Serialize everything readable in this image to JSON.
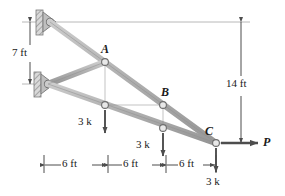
{
  "figure": {
    "type": "truss-free-body-diagram",
    "colors": {
      "member_fill": "#b3b3b3",
      "member_stroke": "#8c8c8c",
      "joint_fill": "#e6e6e6",
      "joint_stroke": "#737373",
      "arrow": "#4d4d4d",
      "dimension_line": "#4d4d4d",
      "extension_line": "#999999",
      "text": "#1a1a1a",
      "background": "#ffffff"
    }
  },
  "joints": [
    {
      "name": "top-support",
      "label": "",
      "x": 50,
      "y": 22
    },
    {
      "name": "lower-support",
      "label": "",
      "x": 48,
      "y": 84
    },
    {
      "name": "joint-a",
      "label": "A",
      "x": 105,
      "y": 62
    },
    {
      "name": "joint-d",
      "label": "",
      "x": 105,
      "y": 105
    },
    {
      "name": "joint-b",
      "label": "B",
      "x": 163,
      "y": 105
    },
    {
      "name": "joint-e",
      "label": "",
      "x": 163,
      "y": 128
    },
    {
      "name": "joint-c",
      "label": "C",
      "x": 216,
      "y": 143
    }
  ],
  "joint_labels": {
    "a": "A",
    "b": "B",
    "c": "C"
  },
  "loads": [
    {
      "name": "load-at-d",
      "label": "3 k",
      "direction": "down",
      "magnitude": 3,
      "unit": "k"
    },
    {
      "name": "load-at-e",
      "label": "3 k",
      "direction": "down",
      "magnitude": 3,
      "unit": "k"
    },
    {
      "name": "load-at-c-vertical",
      "label": "3 k",
      "direction": "down",
      "magnitude": 3,
      "unit": "k"
    },
    {
      "name": "load-at-c-horizontal",
      "label": "P",
      "direction": "right",
      "magnitude": null,
      "unit": ""
    }
  ],
  "dimensions": {
    "vertical_left": {
      "label": "7 ft",
      "value": 7,
      "unit": "ft"
    },
    "vertical_right": {
      "label": "14 ft",
      "value": 14,
      "unit": "ft"
    },
    "horizontal": [
      {
        "label": "6 ft",
        "value": 6,
        "unit": "ft"
      },
      {
        "label": "6 ft",
        "value": 6,
        "unit": "ft"
      },
      {
        "label": "6 ft",
        "value": 6,
        "unit": "ft"
      }
    ]
  }
}
